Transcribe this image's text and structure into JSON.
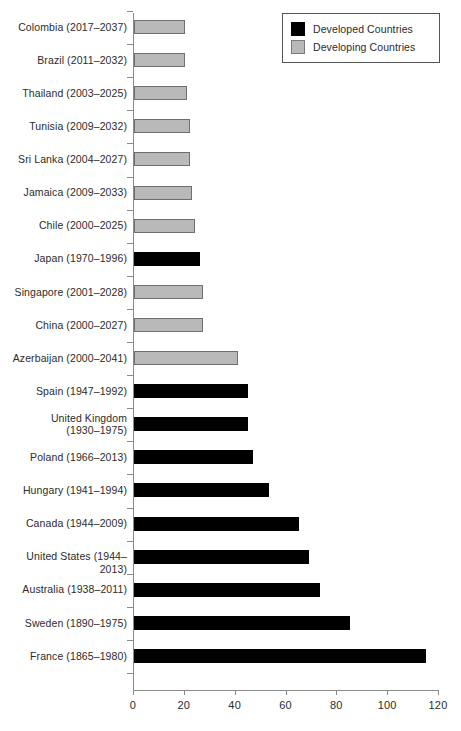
{
  "chart": {
    "type": "bar",
    "orientation": "horizontal",
    "title": "",
    "xlabel": "",
    "ylabel": ""
  },
  "legend": {
    "position": "top-right",
    "entries": [
      {
        "label": "Developed Countries",
        "color": "#000000",
        "key": "developed"
      },
      {
        "label": "Developing Countries",
        "color": "#b9b9b9",
        "key": "developing"
      }
    ]
  },
  "axis": {
    "x_ticks": [
      "0",
      "20",
      "40",
      "60",
      "80",
      "100",
      "120"
    ],
    "x_min": 0,
    "x_max": 120,
    "grid": false
  },
  "chart_data": {
    "type": "bar",
    "orientation": "horizontal",
    "title": "",
    "xlabel": "",
    "ylabel": "",
    "xlim": [
      0,
      120
    ],
    "x_ticks": [
      0,
      20,
      40,
      60,
      80,
      100,
      120
    ],
    "grid": false,
    "legend": [
      "Developed Countries",
      "Developing Countries"
    ],
    "legend_position": "top-right",
    "categories": [
      "Colombia (2017–2037)",
      "Brazil (2011–2032)",
      "Thailand (2003–2025)",
      "Tunisia (2009–2032)",
      "Sri Lanka (2004–2027)",
      "Jamaica (2009–2033)",
      "Chile (2000–2025)",
      "Japan (1970–1996)",
      "Singapore (2001–2028)",
      "China (2000–2027)",
      "Azerbaijan (2000–2041)",
      "Spain (1947–1992)",
      "United Kingdom (1930–1975)",
      "Poland (1966–2013)",
      "Hungary (1941–1994)",
      "Canada (1944–2009)",
      "United States (1944–2013)",
      "Australia (1938–2011)",
      "Sweden (1890–1975)",
      "France (1865–1980)"
    ],
    "values": [
      20,
      20,
      21,
      22,
      22,
      23,
      24,
      26,
      27,
      27,
      41,
      45,
      45,
      47,
      53,
      65,
      69,
      73,
      85,
      115
    ],
    "groups": [
      "developing",
      "developing",
      "developing",
      "developing",
      "developing",
      "developing",
      "developing",
      "developed",
      "developing",
      "developing",
      "developing",
      "developed",
      "developed",
      "developed",
      "developed",
      "developed",
      "developed",
      "developed",
      "developed",
      "developed"
    ]
  },
  "bars": [
    {
      "label": "Colombia (2017–2037)",
      "label_lines": [
        "Colombia (2017–2037)"
      ],
      "value": 20,
      "group": "developing"
    },
    {
      "label": "Brazil (2011–2032)",
      "label_lines": [
        "Brazil (2011–2032)"
      ],
      "value": 20,
      "group": "developing"
    },
    {
      "label": "Thailand (2003–2025)",
      "label_lines": [
        "Thailand (2003–2025)"
      ],
      "value": 21,
      "group": "developing"
    },
    {
      "label": "Tunisia (2009–2032)",
      "label_lines": [
        "Tunisia (2009–2032)"
      ],
      "value": 22,
      "group": "developing"
    },
    {
      "label": "Sri Lanka (2004–2027)",
      "label_lines": [
        "Sri Lanka (2004–2027)"
      ],
      "value": 22,
      "group": "developing"
    },
    {
      "label": "Jamaica (2009–2033)",
      "label_lines": [
        "Jamaica (2009–2033)"
      ],
      "value": 23,
      "group": "developing"
    },
    {
      "label": "Chile (2000–2025)",
      "label_lines": [
        "Chile (2000–2025)"
      ],
      "value": 24,
      "group": "developing"
    },
    {
      "label": "Japan (1970–1996)",
      "label_lines": [
        "Japan (1970–1996)"
      ],
      "value": 26,
      "group": "developed"
    },
    {
      "label": "Singapore (2001–2028)",
      "label_lines": [
        "Singapore (2001–2028)"
      ],
      "value": 27,
      "group": "developing"
    },
    {
      "label": "China (2000–2027)",
      "label_lines": [
        "China (2000–2027)"
      ],
      "value": 27,
      "group": "developing"
    },
    {
      "label": "Azerbaijan (2000–2041)",
      "label_lines": [
        "Azerbaijan (2000–2041)"
      ],
      "value": 41,
      "group": "developing"
    },
    {
      "label": "Spain (1947–1992)",
      "label_lines": [
        "Spain (1947–1992)"
      ],
      "value": 45,
      "group": "developed"
    },
    {
      "label": "United Kingdom (1930–1975)",
      "label_lines": [
        "United Kingdom",
        "(1930–1975)"
      ],
      "value": 45,
      "group": "developed"
    },
    {
      "label": "Poland (1966–2013)",
      "label_lines": [
        "Poland (1966–2013)"
      ],
      "value": 47,
      "group": "developed"
    },
    {
      "label": "Hungary (1941–1994)",
      "label_lines": [
        "Hungary (1941–1994)"
      ],
      "value": 53,
      "group": "developed"
    },
    {
      "label": "Canada (1944–2009)",
      "label_lines": [
        "Canada (1944–2009)"
      ],
      "value": 65,
      "group": "developed"
    },
    {
      "label": "United States (1944–2013)",
      "label_lines": [
        "United States (1944–2013)"
      ],
      "value": 69,
      "group": "developed"
    },
    {
      "label": "Australia (1938–2011)",
      "label_lines": [
        "Australia (1938–2011)"
      ],
      "value": 73,
      "group": "developed"
    },
    {
      "label": "Sweden (1890–1975)",
      "label_lines": [
        "Sweden (1890–1975)"
      ],
      "value": 85,
      "group": "developed"
    },
    {
      "label": "France (1865–1980)",
      "label_lines": [
        "France (1865–1980)"
      ],
      "value": 115,
      "group": "developed"
    }
  ],
  "colors": {
    "developed": "#000000",
    "developing": "#b9b9b9",
    "developing_border": "#6f6f6f",
    "axis": "#8a8a8a",
    "text": "#2b2b2b",
    "background": "#ffffff"
  }
}
